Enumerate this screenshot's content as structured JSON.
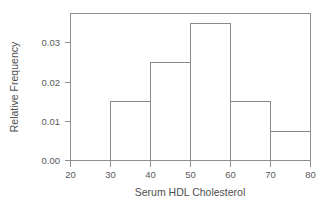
{
  "chart_data": {
    "type": "bar",
    "title": "",
    "xlabel": "Serum HDL Cholesterol",
    "ylabel": "Relative Frequency",
    "bin_edges": [
      20,
      30,
      40,
      50,
      60,
      70,
      80
    ],
    "categories": [
      "20-30",
      "30-40",
      "40-50",
      "50-60",
      "60-70",
      "70-80"
    ],
    "values": [
      0.0025,
      0.015,
      0.025,
      0.035,
      0.015,
      0.0075
    ],
    "xlim": [
      20,
      80
    ],
    "ylim": [
      0,
      0.0375
    ],
    "xticks": [
      20,
      30,
      40,
      50,
      60,
      70,
      80
    ],
    "xtick_labels": [
      "20",
      "30",
      "40",
      "50",
      "60",
      "70",
      "80"
    ],
    "yticks": [
      0.0,
      0.01,
      0.02,
      0.03
    ],
    "ytick_labels": [
      "0.00",
      "0.01",
      "0.02",
      "0.03"
    ],
    "grid": false,
    "legend": null,
    "bar_fill_color": "#ffffff",
    "bar_edge_color": "#8a8a8a",
    "axis_color": "#8f8f8f",
    "background_color": "#ffffff"
  },
  "axes": {
    "y_title": "Relative Frequency",
    "x_title": "Serum HDL Cholesterol",
    "y_tick_0": "0.00",
    "y_tick_1": "0.01",
    "y_tick_2": "0.02",
    "y_tick_3": "0.03",
    "x_tick_0": "20",
    "x_tick_1": "30",
    "x_tick_2": "40",
    "x_tick_3": "50",
    "x_tick_4": "60",
    "x_tick_5": "70",
    "x_tick_6": "80"
  }
}
